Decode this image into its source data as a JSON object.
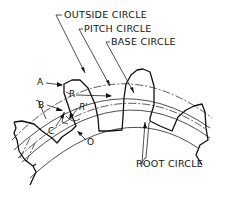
{
  "diagram": {
    "labels": {
      "outside_circle": "OUTSIDE CIRCLE",
      "pitch_circle": "PITCH CIRCLE",
      "base_circle": "BASE CIRCLE",
      "root_circle": "ROOT CIRCLE",
      "a": "A",
      "b": "B",
      "c": "C",
      "o": "O",
      "r": "R",
      "r_prime": "R'"
    },
    "colors": {
      "ink": "#111111",
      "background": "#ffffff"
    }
  }
}
